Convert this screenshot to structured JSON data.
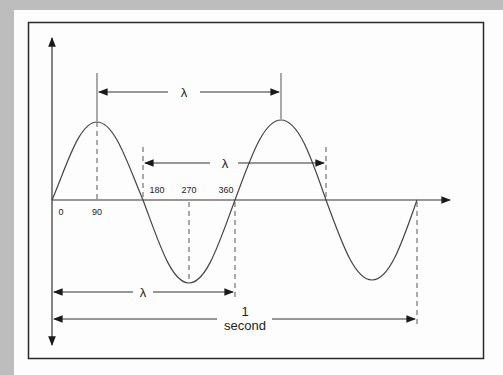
{
  "diagram": {
    "background_color": "#bdbdbd",
    "panel_color": "#fdfdfd",
    "line_color": "#333333",
    "degree_labels": [
      "0",
      "90",
      "180",
      "270",
      "360"
    ],
    "wavelength_symbol": "λ",
    "wavelength_markers": [
      {
        "name": "peak-to-peak",
        "label": "λ"
      },
      {
        "name": "zero-to-zero",
        "label": "λ"
      },
      {
        "name": "origin-to-360",
        "label": "λ"
      }
    ],
    "period_label_line1": "1",
    "period_label_line2": "second",
    "cycles_shown": 2
  }
}
